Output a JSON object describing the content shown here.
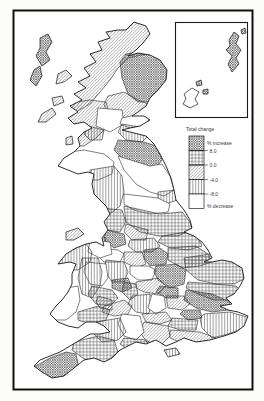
{
  "legend": {
    "title": "Total change",
    "increase_label": "% increase",
    "decrease_label": "% decrease",
    "ticks": [
      "8.0",
      "0.0",
      "-4.0",
      "-8.0"
    ]
  },
  "classes": [
    {
      "id": "increase",
      "pattern": "dense-crosshatch",
      "band": "above 8.0 — % increase"
    },
    {
      "id": "band-0-8",
      "pattern": "square-grid",
      "band": "0.0 to 8.0"
    },
    {
      "id": "band-m4-0",
      "pattern": "diagonal-hatch",
      "band": "-4.0 to 0.0"
    },
    {
      "id": "band-m8-m4",
      "pattern": "vertical-lines",
      "band": "-8.0 to -4.0"
    },
    {
      "id": "decrease",
      "pattern": "blank",
      "band": "below -8.0 — % decrease"
    }
  ],
  "colors": {
    "ink": "#1c1c1c",
    "paper": "#ffffff"
  }
}
